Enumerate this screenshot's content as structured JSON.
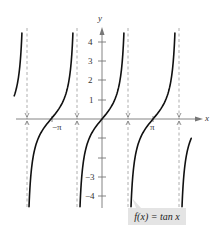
{
  "chart_data": {
    "type": "line",
    "title": "",
    "function_label": "f(x) = tan x",
    "xlabel": "x",
    "ylabel": "y",
    "x_tick_labels": [
      "−π",
      "π"
    ],
    "y_tick_labels": [
      "4",
      "3",
      "2",
      "1",
      "−3",
      "−4"
    ],
    "y_ticks": [
      4,
      3,
      2,
      1,
      -1,
      -2,
      -3,
      -4
    ],
    "xlim": [
      -3.85,
      5.7
    ],
    "ylim": [
      -4.3,
      4.3
    ],
    "asymptotes": [
      "-3π/2",
      "-π/2",
      "π/2",
      "3π/2"
    ],
    "series": [
      {
        "name": "tan x",
        "description": "branches of tangent between vertical asymptotes",
        "x_zeros": [
          "-π",
          "0",
          "π"
        ]
      }
    ],
    "grid": false,
    "legend": "none"
  },
  "labels": {
    "x_axis": "x",
    "y_axis": "y",
    "neg_pi": "−π",
    "pi": "π",
    "y4": "4",
    "y3": "3",
    "y2": "2",
    "y1": "1",
    "ym3": "−3",
    "ym4": "−4",
    "function_label": "f(x) = tan x"
  },
  "colors": {
    "curve": "#111111",
    "axis": "#777777",
    "asymptote": "#999999",
    "label_box": "#e4e4e4"
  }
}
